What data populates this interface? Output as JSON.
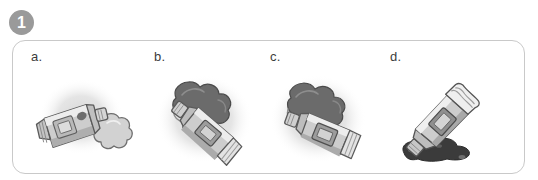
{
  "question": {
    "number": "1",
    "badge_color": "#9a9a9a",
    "badge_text_color": "#ffffff"
  },
  "panel": {
    "border_color": "#c9c9c9",
    "background_color": "#ffffff",
    "corner_radius_px": 13
  },
  "palette": {
    "blob_light": "#d2d2d2",
    "blob_dark": "#6b6b6b",
    "blob_very_dark": "#3b3b3b",
    "halo_gray": "#dcdcdc",
    "tube_body": "#b6b6b6",
    "tube_highlight": "#ececec",
    "tube_outline": "#5a5a5a",
    "tube_panel": "#8f8f8f",
    "label_color": "#3c3c3c"
  },
  "options": [
    {
      "id": "a",
      "label": "a.",
      "illustration_name": "paint-tube-small-light-blob",
      "description": "Paint tube lying flat pointing right with a small light-gray blob of paint beside the nozzle",
      "tube_orientation": "horizontal-right",
      "blob_size": "small",
      "blob_tone": "light",
      "has_halo": true
    },
    {
      "id": "b",
      "label": "b.",
      "illustration_name": "paint-tube-large-dark-blob-upper-left",
      "description": "Paint tube angled with nozzle to the upper left and a large dark blob of paint",
      "tube_orientation": "diagonal-up-left",
      "blob_size": "large",
      "blob_tone": "dark",
      "has_halo": true
    },
    {
      "id": "c",
      "label": "c.",
      "illustration_name": "paint-tube-large-dark-blob-left",
      "description": "Paint tube angled with nozzle to the left and a large dark blob of paint",
      "tube_orientation": "diagonal-left",
      "blob_size": "large",
      "blob_tone": "dark",
      "has_halo": true
    },
    {
      "id": "d",
      "label": "d.",
      "illustration_name": "paint-tube-pouring-dark-puddle",
      "description": "Paint tube tilted nozzle down pouring paint into a dark puddle below",
      "tube_orientation": "diagonal-down-left",
      "blob_size": "puddle",
      "blob_tone": "very-dark",
      "has_halo": false
    }
  ]
}
